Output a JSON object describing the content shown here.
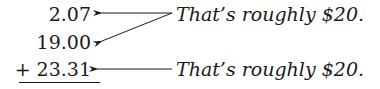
{
  "numbers": [
    "2.07",
    "19.00",
    "+ 23.31"
  ],
  "notes": [
    "That’s roughly $20.",
    "That’s roughly $20."
  ],
  "colors": {
    "ink": "#1a1a1a",
    "background": "#ffffff"
  }
}
